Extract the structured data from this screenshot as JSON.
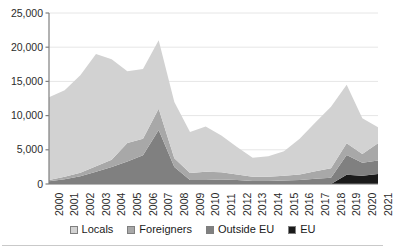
{
  "chart_data": {
    "type": "area",
    "stacked": true,
    "title": "",
    "xlabel": "",
    "ylabel": "",
    "ylim": [
      0,
      25000
    ],
    "ytick_values": [
      0,
      5000,
      10000,
      15000,
      20000,
      25000
    ],
    "ytick_labels": [
      "0",
      "5,000",
      "10,000",
      "15,000",
      "20,000",
      "25,000"
    ],
    "grid": true,
    "legend_position": "bottom",
    "categories": [
      "2000",
      "2001",
      "2002",
      "2003",
      "2004",
      "2005",
      "2006",
      "2007",
      "2008",
      "2009",
      "2010",
      "2011",
      "2012",
      "2013",
      "2014",
      "2015",
      "2016",
      "2017",
      "2018",
      "2019",
      "2020",
      "2021"
    ],
    "series": [
      {
        "name": "EU",
        "color": "#1a1a1a",
        "values": [
          0,
          0,
          0,
          0,
          0,
          0,
          0,
          0,
          0,
          0,
          0,
          0,
          0,
          0,
          0,
          0,
          0,
          0,
          0,
          1350,
          1200,
          1450
        ]
      },
      {
        "name": "Outside EU",
        "color": "#808080",
        "values": [
          400,
          700,
          1150,
          1800,
          2500,
          3300,
          4200,
          7900,
          2500,
          600,
          600,
          650,
          600,
          450,
          450,
          500,
          600,
          750,
          900,
          2900,
          1900,
          2000
        ]
      },
      {
        "name": "Foreigners",
        "color": "#a8a8a8",
        "values": [
          200,
          350,
          500,
          800,
          1050,
          2700,
          2400,
          3100,
          1250,
          1000,
          1200,
          1050,
          800,
          600,
          600,
          700,
          800,
          1100,
          1400,
          1700,
          1300,
          2500
        ]
      },
      {
        "name": "Locals",
        "color": "#d2d2d2",
        "values": [
          12100,
          12650,
          14250,
          16400,
          14700,
          10500,
          10200,
          10000,
          8250,
          6000,
          6600,
          5400,
          4000,
          2800,
          3000,
          3600,
          5200,
          7150,
          9000,
          8550,
          5200,
          2350
        ]
      }
    ],
    "totals": [
      12700,
      13700,
      15900,
      19000,
      18250,
      16500,
      16800,
      21000,
      12000,
      7600,
      8400,
      7100,
      5400,
      3850,
      4050,
      4800,
      6600,
      9000,
      11300,
      14500,
      9600,
      8300
    ]
  },
  "yaxis": {
    "ticks": [
      "25,000",
      "20,000",
      "15,000",
      "10,000",
      "5,000",
      "0"
    ]
  },
  "xaxis": {
    "ticks": [
      "2000",
      "2001",
      "2002",
      "2003",
      "2004",
      "2005",
      "2006",
      "2007",
      "2008",
      "2009",
      "2010",
      "2011",
      "2012",
      "2013",
      "2014",
      "2015",
      "2016",
      "2017",
      "2018",
      "2019",
      "2020",
      "2021"
    ]
  },
  "legend": {
    "items": [
      {
        "label": "Locals",
        "color": "#d2d2d2"
      },
      {
        "label": "Foreigners",
        "color": "#a8a8a8"
      },
      {
        "label": "Outside EU",
        "color": "#808080"
      },
      {
        "label": "EU",
        "color": "#1a1a1a"
      }
    ]
  },
  "colors": {
    "axis": "#7f7f7f",
    "grid": "#e6e6e6",
    "text": "#2b2b2b",
    "rule": "#c9c9c9",
    "background": "#ffffff"
  }
}
